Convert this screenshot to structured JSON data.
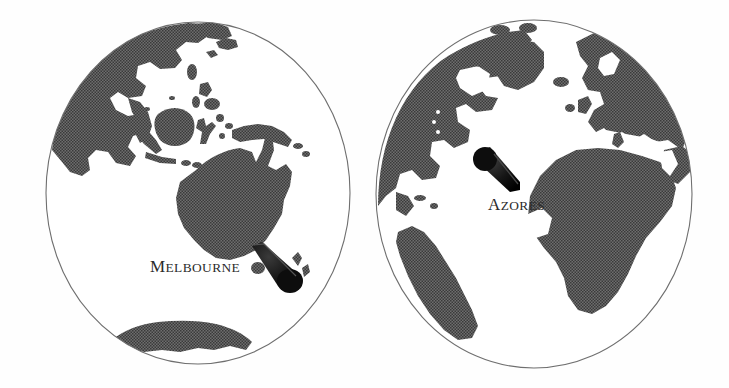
{
  "figure": {
    "name": "two-hemisphere-globe-illustration",
    "background_color": "#ffffff",
    "width": 729,
    "height": 388,
    "style": "black-and-white dithered halftone engraving"
  },
  "colors": {
    "land_fill": "#5c5c5c",
    "land_fill_dark": "#4a4a4a",
    "ocean_fill": "#ffffff",
    "outline_stroke": "#777777",
    "marker_fill": "#111111",
    "label_color": "#2b2b2b"
  },
  "globes": [
    {
      "id": "globe-left",
      "name": "eastern-hemisphere-globe",
      "center_x": 198,
      "center_y": 193,
      "radius_x": 152,
      "radius_y": 171,
      "label": {
        "text": "Melbourne",
        "first_letter": "M",
        "rest": "ELBOURNE",
        "x": 150,
        "y": 271,
        "style": "small-caps-serif"
      },
      "marker": {
        "name": "cone-marker-melbourne",
        "tip_x": 255,
        "tip_y": 247,
        "wide_x": 293,
        "wide_y": 283,
        "shape": "tapered-cone"
      },
      "landmasses": [
        "Asia",
        "Southeast Asia",
        "Philippines",
        "Borneo",
        "Sulawesi",
        "Sumatra",
        "Java",
        "New Guinea",
        "Australia",
        "Tasmania",
        "New Zealand",
        "Antarctica",
        "Madagascar"
      ]
    },
    {
      "id": "globe-right",
      "name": "atlantic-hemisphere-globe",
      "center_x": 534,
      "center_y": 194,
      "radius_x": 158,
      "radius_y": 174,
      "label": {
        "text": "Azores",
        "first_letter": "A",
        "rest": "ZORES",
        "x": 488,
        "y": 209,
        "style": "small-caps-serif"
      },
      "marker": {
        "name": "cone-marker-azores",
        "tip_x": 514,
        "tip_y": 190,
        "wide_x": 482,
        "wide_y": 155,
        "shape": "tapered-cone"
      },
      "landmasses": [
        "North America",
        "Greenland",
        "Baffin Island",
        "Iceland",
        "Europe",
        "Scandinavia",
        "British Isles",
        "Mediterranean Sea",
        "Africa",
        "South America",
        "Arabian Peninsula"
      ]
    }
  ]
}
